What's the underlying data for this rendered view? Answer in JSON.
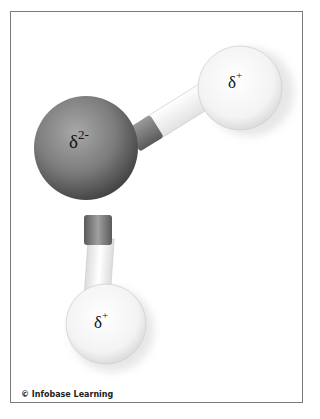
{
  "diagram": {
    "atoms": [
      {
        "name": "oxygen",
        "charge_symbol": "δ",
        "charge_sup": "2-",
        "color": "#7a7a7a"
      },
      {
        "name": "hydrogen-upper",
        "charge_symbol": "δ",
        "charge_sup": "+",
        "color": "#f2f2f2"
      },
      {
        "name": "hydrogen-lower",
        "charge_symbol": "δ",
        "charge_sup": "+",
        "color": "#f2f2f2"
      }
    ]
  },
  "credit": "© Infobase Learning"
}
